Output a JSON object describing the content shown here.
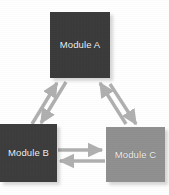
{
  "diagram": {
    "type": "node-link-diagram",
    "background_color": "#ffffff",
    "width": 169,
    "height": 195,
    "nodes": [
      {
        "id": "a",
        "label": "Module A",
        "shape": "square",
        "fill_color": "#3b3b3b",
        "text_color": "#f2f2f2",
        "position": "top-center"
      },
      {
        "id": "b",
        "label": "Module B",
        "shape": "square",
        "fill_color": "#3d3d3d",
        "text_color": "#f2f2f2",
        "position": "bottom-left"
      },
      {
        "id": "c",
        "label": "Module C",
        "shape": "square",
        "fill_color": "#909090",
        "text_color": "#f2f2f2",
        "position": "bottom-right"
      }
    ],
    "edges": [
      {
        "id": "a-to-b",
        "from": "a",
        "to": "b",
        "direction": "down-left",
        "color": "#b0b0b0"
      },
      {
        "id": "b-to-a",
        "from": "b",
        "to": "a",
        "direction": "up-right",
        "color": "#b0b0b0"
      },
      {
        "id": "a-to-c",
        "from": "a",
        "to": "c",
        "direction": "down-right",
        "color": "#b0b0b0"
      },
      {
        "id": "c-to-a",
        "from": "c",
        "to": "a",
        "direction": "up-left",
        "color": "#b0b0b0"
      },
      {
        "id": "b-to-c",
        "from": "b",
        "to": "c",
        "direction": "right",
        "color": "#b0b0b0"
      },
      {
        "id": "c-to-b",
        "from": "c",
        "to": "b",
        "direction": "left",
        "color": "#b0b0b0"
      }
    ],
    "arrow_color": "#b0b0b0",
    "arrow_style": "solid-triangle-head"
  }
}
